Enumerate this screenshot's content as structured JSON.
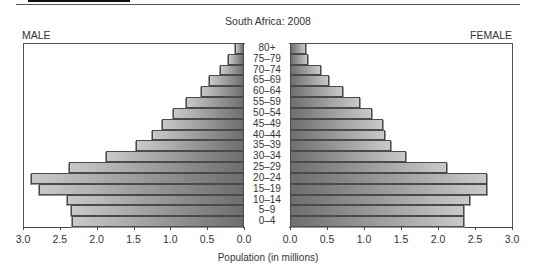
{
  "chart_data": {
    "type": "bar",
    "subtype": "population-pyramid",
    "title": "South Africa: 2008",
    "xlabel": "Population (in millions)",
    "ylabel": "",
    "categories": [
      "80+",
      "75–79",
      "70–74",
      "65–69",
      "60–64",
      "55–59",
      "50–54",
      "45–49",
      "40–44",
      "35–39",
      "30–34",
      "25–29",
      "20–24",
      "15–19",
      "10–14",
      "5–9",
      "0–4"
    ],
    "series": [
      {
        "name": "MALE",
        "values": [
          0.12,
          0.22,
          0.33,
          0.48,
          0.59,
          0.79,
          0.97,
          1.12,
          1.25,
          1.47,
          1.88,
          2.37,
          2.89,
          2.78,
          2.4,
          2.35,
          2.33
        ]
      },
      {
        "name": "FEMALE",
        "values": [
          0.22,
          0.24,
          0.42,
          0.53,
          0.71,
          0.94,
          1.11,
          1.25,
          1.29,
          1.37,
          1.57,
          2.12,
          2.66,
          2.66,
          2.43,
          2.35,
          2.35
        ]
      }
    ],
    "xlim": [
      0,
      3.0
    ],
    "male_ticks": [
      "3.0",
      "2.5",
      "2.0",
      "1.5",
      "1.0",
      "0.5",
      "0.0"
    ],
    "female_ticks": [
      "0.0",
      "0.5",
      "1.0",
      "1.5",
      "2.0",
      "2.5",
      "3.0"
    ],
    "grid": false,
    "legend": {
      "left": "MALE",
      "right": "FEMALE"
    }
  },
  "labels": {
    "title": "South Africa: 2008",
    "male": "MALE",
    "female": "FEMALE",
    "xlabel": "Population (in millions)"
  },
  "colors": {
    "bar_dark": "#6e6e6e",
    "bar_light": "#c9c9c9",
    "outline": "#4a4a4a"
  }
}
